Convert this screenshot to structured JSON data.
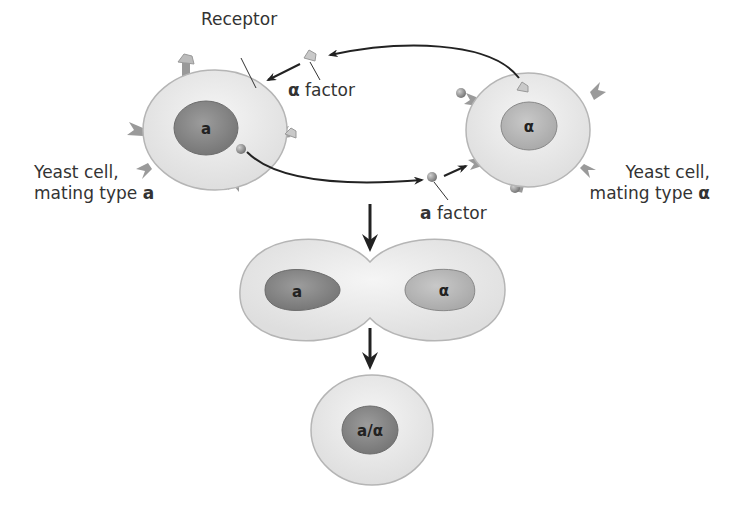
{
  "labels": {
    "receptor": "Receptor",
    "alpha_factor_symbol": "α",
    "alpha_factor_text": " factor",
    "a_factor_symbol": "a",
    "a_factor_text": " factor",
    "cell_a_line1": "Yeast cell,",
    "cell_a_line2": "mating type ",
    "cell_a_type": "a",
    "cell_alpha_line1": "Yeast cell,",
    "cell_alpha_line2": "mating type ",
    "cell_alpha_type": "α"
  },
  "nuclei": {
    "cell_a": "a",
    "cell_alpha": "α",
    "fused_left": "a",
    "fused_right": "α",
    "diploid": "a/α"
  },
  "colors": {
    "cytoplasm": "#e9e9e9",
    "cell_outline": "#b5b5b5",
    "nucleus_a": "#8a8a8a",
    "nucleus_alpha": "#b9b9b9",
    "receptor": "#9a9a9a",
    "arrow": "#222222"
  }
}
